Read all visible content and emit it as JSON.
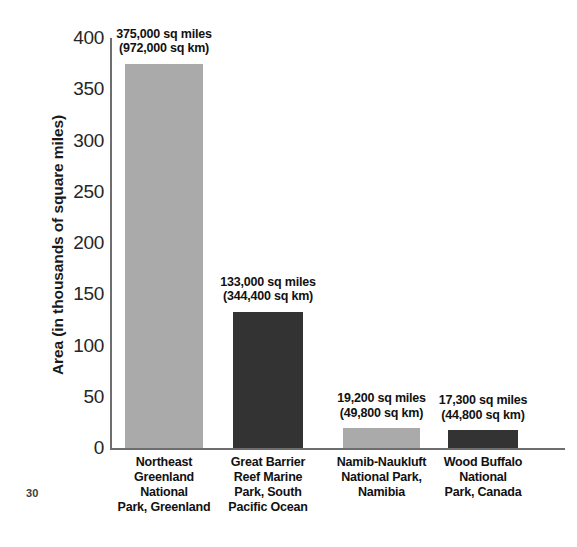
{
  "page": {
    "page_number": "30",
    "background_color": "#ffffff"
  },
  "chart_data": {
    "type": "bar",
    "title": "",
    "xlabel": "",
    "ylabel": "Area (in thousands of square miles)",
    "ylim": [
      0,
      400
    ],
    "ytick_labels": [
      "400",
      "350",
      "300",
      "250",
      "200",
      "150",
      "100",
      "50",
      "0"
    ],
    "ytick_values": [
      400,
      350,
      300,
      250,
      200,
      150,
      100,
      50,
      0
    ],
    "grid": false,
    "legend": "none",
    "categories": [
      "Northeast\nGreenland\nNational\nPark, Greenland",
      "Great Barrier\nReef Marine\nPark, South\nPacific Ocean",
      "Namib-Naukluft\nNational Park,\nNamibia",
      "Wood Buffalo\nNational\nPark, Canada"
    ],
    "values": [
      375,
      133,
      19.2,
      17.3
    ],
    "bars": [
      {
        "category_lines": [
          "Northeast",
          "Greenland",
          "National",
          "Park, Greenland"
        ],
        "value": 375,
        "value_label_miles": "375,000 sq miles",
        "value_label_km": "(972,000 sq km)",
        "color": "#aaaaaa"
      },
      {
        "category_lines": [
          "Great Barrier",
          "Reef Marine",
          "Park, South",
          "Pacific Ocean"
        ],
        "value": 133,
        "value_label_miles": "133,000 sq miles",
        "value_label_km": "(344,400 sq km)",
        "color": "#333333"
      },
      {
        "category_lines": [
          "Namib-Naukluft",
          "National Park,",
          "Namibia"
        ],
        "value": 19.2,
        "value_label_miles": "19,200 sq miles",
        "value_label_km": "(49,800 sq km)",
        "color": "#aaaaaa"
      },
      {
        "category_lines": [
          "Wood Buffalo",
          "National",
          "Park, Canada"
        ],
        "value": 17.3,
        "value_label_miles": "17,300 sq miles",
        "value_label_km": "(44,800 sq km)",
        "color": "#333333"
      }
    ],
    "colors": {
      "bar_light": "#aaaaaa",
      "bar_dark": "#333333",
      "axis": "#6e6e6e",
      "text": "#111111"
    }
  }
}
